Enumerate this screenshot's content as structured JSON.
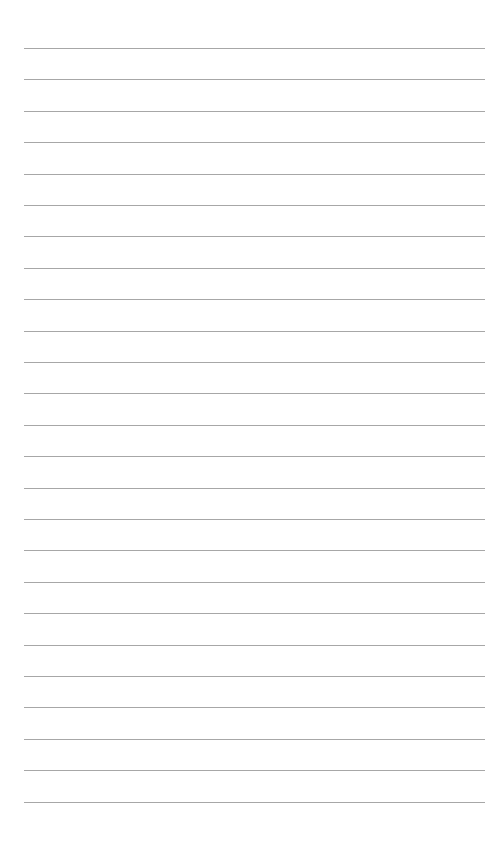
{
  "page": {
    "type": "lined-paper",
    "background": "#ffffff",
    "line_color": "#8a8a8a",
    "line_count": 25,
    "first_line_y": 48,
    "line_spacing": 31.4,
    "line_left": 24,
    "line_right": 485
  }
}
